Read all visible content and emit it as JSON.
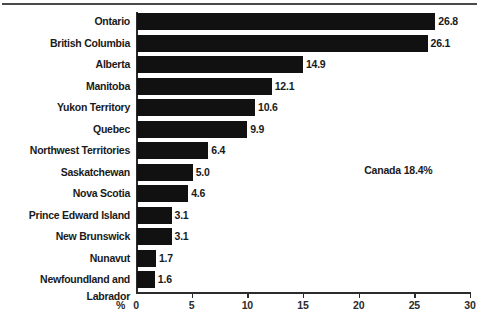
{
  "chart_data": {
    "type": "bar",
    "orientation": "horizontal",
    "title": "",
    "xlabel": "%",
    "ylabel": "",
    "xlim": [
      0,
      30
    ],
    "xticks": [
      0,
      5,
      10,
      15,
      20,
      25,
      30
    ],
    "xtick_labels": [
      "0",
      "5",
      "10",
      "15",
      "20",
      "25",
      "30"
    ],
    "grid": false,
    "legend": false,
    "bar_color": "#111111",
    "axis_color": "#2b2b2b",
    "categories": [
      "Ontario",
      "British Columbia",
      "Alberta",
      "Manitoba",
      "Yukon Territory",
      "Quebec",
      "Northwest Territories",
      "Saskatchewan",
      "Nova Scotia",
      "Prince Edward Island",
      "New Brunswick",
      "Nunavut",
      "Newfoundland and Labrador"
    ],
    "values": [
      26.8,
      26.1,
      14.9,
      12.1,
      10.6,
      9.9,
      6.4,
      5.0,
      4.6,
      3.1,
      3.1,
      1.7,
      1.6
    ],
    "value_labels": [
      "26.8",
      "26.1",
      "14.9",
      "12.1",
      "10.6",
      "9.9",
      "6.4",
      "5.0",
      "4.6",
      "3.1",
      "3.1",
      "1.7",
      "1.6"
    ],
    "annotations": [
      {
        "text": "Canada 18.4%",
        "x": 20.5,
        "y_row": 7
      }
    ]
  },
  "axis": {
    "percent_symbol": "%"
  }
}
